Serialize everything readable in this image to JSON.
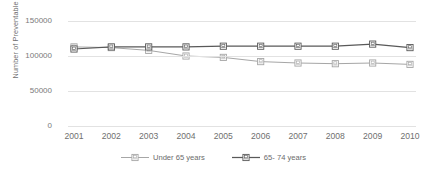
{
  "chart_data": {
    "type": "line",
    "title": "",
    "xlabel": "",
    "ylabel": "Number of Preventable Deaths",
    "x": [
      "2001",
      "2002",
      "2003",
      "2004",
      "2005",
      "2006",
      "2007",
      "2008",
      "2009",
      "2010"
    ],
    "ylim": [
      0,
      150000
    ],
    "yticks": [
      "0",
      "50000",
      "100000",
      "150000"
    ],
    "ytick_values": [
      0,
      50000,
      100000,
      150000
    ],
    "grid": true,
    "legend_position": "bottom",
    "series": [
      {
        "name": "Under 65 years",
        "color": "#a6a6a6",
        "marker": "square-outline",
        "values": [
          113000,
          112000,
          108000,
          100000,
          98000,
          92000,
          90000,
          89000,
          90000,
          88000
        ]
      },
      {
        "name": "65- 74 years",
        "color": "#595959",
        "marker": "square-outline",
        "values": [
          110000,
          113000,
          113000,
          113000,
          114000,
          114000,
          114000,
          114000,
          117000,
          112000
        ]
      }
    ]
  },
  "axis": {
    "y_title": "Number of Preventable Deaths"
  },
  "legend": {
    "entries": [
      {
        "label": "Under 65 years"
      },
      {
        "label": "65- 74 years"
      }
    ]
  }
}
